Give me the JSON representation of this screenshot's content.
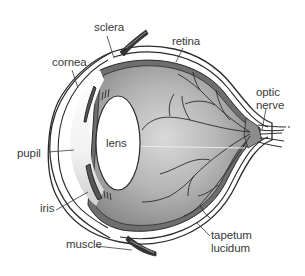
{
  "diagram": {
    "colors": {
      "outline": "#2b2b2b",
      "vitreous": "#a9a9a9",
      "vitreous_light": "#d6d6d6",
      "lens": "#ffffff",
      "choroid": "#6e6e6e",
      "vessels": "#2a2a2a",
      "label_text": "#3a3a3a"
    },
    "labels": {
      "sclera": "sclera",
      "cornea": "cornea",
      "retina": "retina",
      "optic_nerve": "optic\nnerve",
      "lens": "lens",
      "pupil": "pupil",
      "iris": "iris",
      "muscle": "muscle",
      "tapetum_lucidum": "tapetum\nlucidum"
    }
  }
}
